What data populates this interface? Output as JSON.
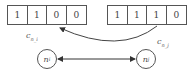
{
  "vectors": {
    "left": {
      "label": "c",
      "label_sub": "n_i",
      "cells": [
        "1",
        "1",
        "0",
        "0"
      ]
    },
    "right": {
      "label": "c",
      "label_sub": "n_j",
      "cells": [
        "1",
        "1",
        "1",
        "0"
      ]
    }
  },
  "nodes": {
    "left": {
      "label": "n",
      "sub": "i"
    },
    "right": {
      "label": "n",
      "sub": "j"
    }
  },
  "edges": [
    {
      "from": "vector-right-cell-3",
      "to": "vector-left-cell-3",
      "type": "curved-arrow"
    },
    {
      "from": "node-left",
      "to": "node-right",
      "type": "bidirectional-arrow"
    }
  ]
}
